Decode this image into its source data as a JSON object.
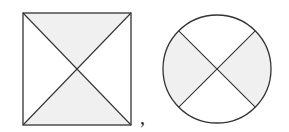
{
  "figure": {
    "separator": ",",
    "shapes": [
      {
        "type": "square",
        "description": "square with both diagonals drawn; top and bottom triangles shaded"
      },
      {
        "type": "circle",
        "description": "circle with two perpendicular diameters at 45 degrees; left and right sectors shaded"
      }
    ],
    "colors": {
      "stroke": "#333333",
      "fill": "#f0f0f0",
      "background": "#ffffff"
    }
  }
}
